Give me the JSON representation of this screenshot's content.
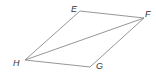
{
  "diagram": {
    "shape": "parallelogram",
    "vertices": [
      {
        "label": "E",
        "x": 80,
        "y": 11,
        "lx": 71,
        "ly": 12
      },
      {
        "label": "F",
        "x": 144,
        "y": 18,
        "lx": 145,
        "ly": 17
      },
      {
        "label": "G",
        "x": 90,
        "y": 67,
        "lx": 96,
        "ly": 69
      },
      {
        "label": "H",
        "x": 25,
        "y": 60,
        "lx": 13,
        "ly": 66
      }
    ],
    "edges": [
      [
        "E",
        "F"
      ],
      [
        "F",
        "G"
      ],
      [
        "G",
        "H"
      ],
      [
        "H",
        "E"
      ]
    ],
    "diagonals": [
      [
        "H",
        "F"
      ]
    ],
    "colors": {
      "line": "#8a8a8a",
      "label": "#333333"
    }
  }
}
